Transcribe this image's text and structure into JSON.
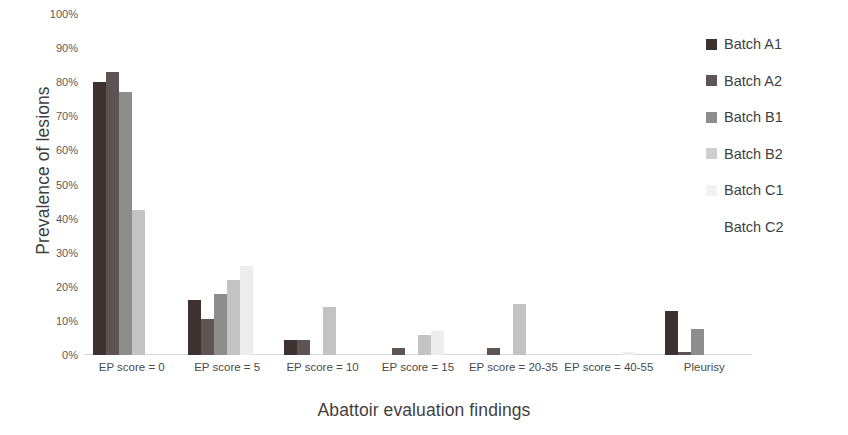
{
  "chart_data": {
    "type": "bar",
    "title": "",
    "xlabel": "Abattoir evaluation findings",
    "ylabel": "Prevalence of lesions",
    "ylim": [
      0,
      100
    ],
    "ytick_labels": [
      "100%",
      "90%",
      "80%",
      "70%",
      "60%",
      "50%",
      "40%",
      "30%",
      "20%",
      "10%",
      "0%"
    ],
    "ytick_values": [
      100,
      90,
      80,
      70,
      60,
      50,
      40,
      30,
      20,
      10,
      0
    ],
    "grid": false,
    "legend_position": "right",
    "categories": [
      "EP score = 0",
      "EP score = 5",
      "EP score = 10",
      "EP score = 15",
      "EP score = 20-35",
      "EP score = 40-55",
      "Pleurisy"
    ],
    "series": [
      {
        "name": "Batch A1",
        "color": "#3d3230",
        "values": [
          80,
          16,
          4.5,
          0,
          0,
          0,
          13
        ]
      },
      {
        "name": "Batch A2",
        "color": "#5c5553",
        "values": [
          83,
          10.5,
          4.5,
          2,
          2,
          0,
          1
        ]
      },
      {
        "name": "Batch B1",
        "color": "#8d8d8d",
        "values": [
          77,
          18,
          0,
          0,
          0,
          0,
          7.5
        ]
      },
      {
        "name": "Batch B2",
        "color": "#c3c3c3",
        "values": [
          42.5,
          22,
          14,
          6,
          15,
          0,
          0
        ]
      },
      {
        "name": "Batch C1",
        "color": "#ededed",
        "values": [
          0,
          26,
          0,
          7,
          0,
          1,
          0
        ]
      },
      {
        "name": "Batch C2",
        "color": "#ffffff",
        "values": [
          0,
          0,
          0,
          0,
          0,
          0,
          0
        ]
      }
    ]
  },
  "legend": {
    "items": [
      {
        "label": "Batch A1",
        "color": "#3d3230"
      },
      {
        "label": "Batch A2",
        "color": "#5c5553"
      },
      {
        "label": "Batch B1",
        "color": "#8d8d8d"
      },
      {
        "label": "Batch B2",
        "color": "#cfcfcf"
      },
      {
        "label": "Batch C1",
        "color": "#f2f2f2"
      },
      {
        "label": "Batch C2",
        "color": "#ffffff"
      }
    ]
  }
}
